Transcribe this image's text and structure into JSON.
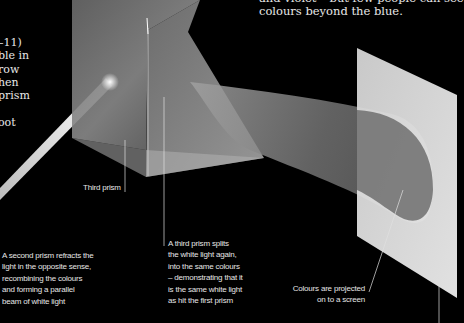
{
  "top_text": {
    "lines": [
      "and violet – but few people can see",
      "colours beyond the blue."
    ]
  },
  "left_text": {
    "lines": [
      "–11)",
      "ble in",
      "row",
      "hen",
      "prism",
      "",
      "oot"
    ]
  },
  "captions": {
    "third_prism_label": "Third prism",
    "second_prism": "A second prism refracts the\nlight in the opposite sense,\nrecombining the colours\nand forming a parallel\nbeam of white light",
    "third_prism_split": "A third prism splits\nthe white light again,\ninto the same colours\n– demonstrating that it\nis the same white light\nas hit the first prism",
    "screen": "Colours are projected\non to a screen"
  },
  "colors": {
    "background": "#000000",
    "text": "#e8e8e8",
    "screen": "#e0e0e0"
  }
}
